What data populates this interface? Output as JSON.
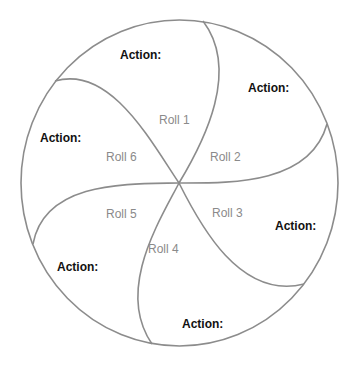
{
  "diagram": {
    "type": "six-segment roll wheel",
    "colors": {
      "stroke": "#8c8c8c",
      "action_text": "#111111",
      "roll_text": "#8a8a8a",
      "background": "#ffffff"
    },
    "segments": [
      {
        "roll": "Roll 1",
        "action": "Action:"
      },
      {
        "roll": "Roll 2",
        "action": "Action:"
      },
      {
        "roll": "Roll 3",
        "action": "Action:"
      },
      {
        "roll": "Roll 4",
        "action": "Action:"
      },
      {
        "roll": "Roll 5",
        "action": "Action:"
      },
      {
        "roll": "Roll 6",
        "action": "Action:"
      }
    ]
  }
}
